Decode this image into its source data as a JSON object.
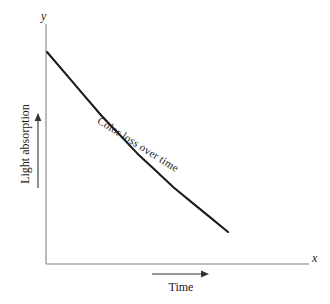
{
  "chart_data": {
    "type": "line",
    "title": "",
    "subtitle": "",
    "xlabel": "Time",
    "ylabel": "Light absorption",
    "x_axis_letter": "x",
    "y_axis_letter": "y",
    "annotation": "Color loss over time",
    "grid": false,
    "legend": false,
    "legend_position": "none",
    "axis_ticks": false,
    "tick_labels_x": [],
    "tick_labels_y": [],
    "xlim": [
      0,
      1
    ],
    "ylim": [
      0,
      1
    ],
    "x_axis_direction_arrow": "right",
    "y_axis_direction_arrow": "up",
    "series": [
      {
        "name": "Color loss over time",
        "color": "#1a1a1a",
        "x": [
          0.0,
          0.1,
          0.2,
          0.3,
          0.4,
          0.5,
          0.6,
          0.7,
          0.8,
          0.9,
          1.0
        ],
        "y": [
          1.0,
          0.9,
          0.8,
          0.7,
          0.61,
          0.52,
          0.44,
          0.36,
          0.29,
          0.22,
          0.15
        ]
      }
    ]
  },
  "figure": {
    "axis_color": "#a9a9a9",
    "curve_color": "#1a1a1a",
    "arrow_color": "#333333",
    "background": "#ffffff"
  },
  "labels": {
    "y_axis_letter": "y",
    "x_axis_letter": "x",
    "y_axis_title": "Light absorption",
    "x_axis_title": "Time",
    "curve_annotation": "Color loss over time"
  }
}
